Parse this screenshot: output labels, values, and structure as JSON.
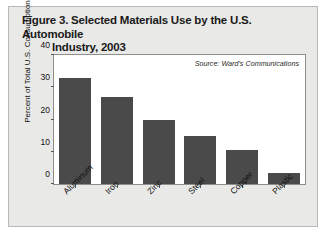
{
  "figure": {
    "title_line1": "Figure 3. Selected Materials Use by the U.S. Automobile",
    "title_line2": "Industry, 2003",
    "background_color": "#e9e9e7",
    "border_color": "#b9b9b7"
  },
  "chart_data": {
    "type": "bar",
    "title": "Figure 3. Selected Materials Use by the U.S. Automobile Industry, 2003",
    "subtitle": "",
    "categories": [
      "Aluminum",
      "Iron",
      "Zinc",
      "Steel",
      "Copper",
      "Plastic"
    ],
    "values": [
      33,
      27,
      20,
      15,
      10.5,
      3.5
    ],
    "xlabel": "",
    "ylabel": "Percent of Total U.S. Consumption",
    "ylim": [
      0,
      40
    ],
    "yticks": [
      0,
      10,
      20,
      30,
      40
    ],
    "ytick_labels": [
      "0",
      "10",
      "20",
      "30",
      "40"
    ],
    "grid": false,
    "legend": false,
    "annotation": "Source: Ward's Communications",
    "annotation_position": "top-right-inside",
    "bar_color": "#4a4a4a",
    "plot_background": "#ffffff",
    "xtick_label_rotation": -45
  }
}
